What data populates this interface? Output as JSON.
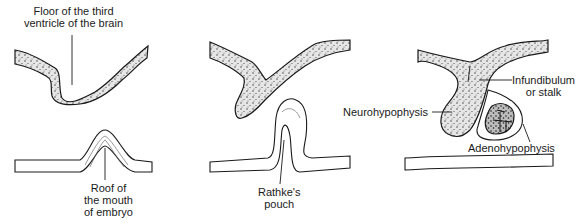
{
  "diagram": {
    "type": "developmental stages of the pituitary gland",
    "stages": [
      {
        "id": "stage-1",
        "labels": {
          "floor": [
            "Floor of the third",
            "ventricle of the brain"
          ],
          "roof": [
            "Roof of",
            "the mouth",
            "of embryo"
          ]
        }
      },
      {
        "id": "stage-2",
        "labels": {
          "pouch": [
            "Rathke's",
            "pouch"
          ]
        }
      },
      {
        "id": "stage-3",
        "labels": {
          "infundibulum": [
            "Infundibulum",
            "or stalk"
          ],
          "neuro": "Neurohypophysis",
          "adeno": "Adenohypophysis"
        }
      }
    ],
    "colors": {
      "ink": "#1a1a1a",
      "stipple_fill": "#d9d9d9",
      "background": "#ffffff"
    }
  }
}
